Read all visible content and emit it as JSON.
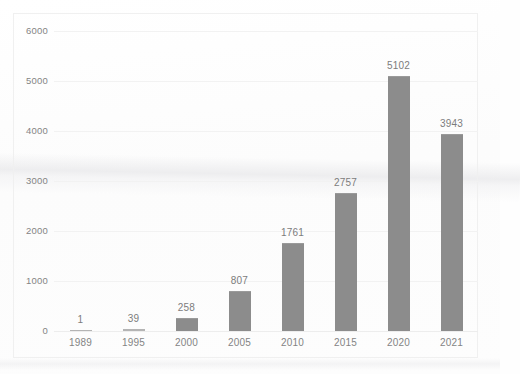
{
  "chart_data": {
    "type": "bar",
    "title": "",
    "subtitle": "",
    "xlabel": "",
    "ylabel": "",
    "categories": [
      "1989",
      "1995",
      "2000",
      "2005",
      "2010",
      "2015",
      "2020",
      "2021"
    ],
    "values": [
      1,
      39,
      258,
      807,
      1761,
      2757,
      5102,
      3943
    ],
    "data_labels": [
      "1",
      "39",
      "258",
      "807",
      "1761",
      "2757",
      "5102",
      "3943"
    ],
    "ylim": [
      0,
      6000
    ],
    "ytick_labels": [
      "6000",
      "5000",
      "4000",
      "3000",
      "2000",
      "1000",
      "0"
    ],
    "ytick_values": [
      6000,
      5000,
      4000,
      3000,
      2000,
      1000,
      0
    ],
    "grid": true,
    "grid_axis": "y",
    "legend": false,
    "legend_position": "none",
    "bar_color": "#8c8c8c",
    "gridline_color": "#f2f2f2",
    "axis_text_color": "#848484",
    "data_label_color": "#7c7c7c",
    "background_color": "#fefefe",
    "plot_border_color": "#f0f0f0"
  }
}
